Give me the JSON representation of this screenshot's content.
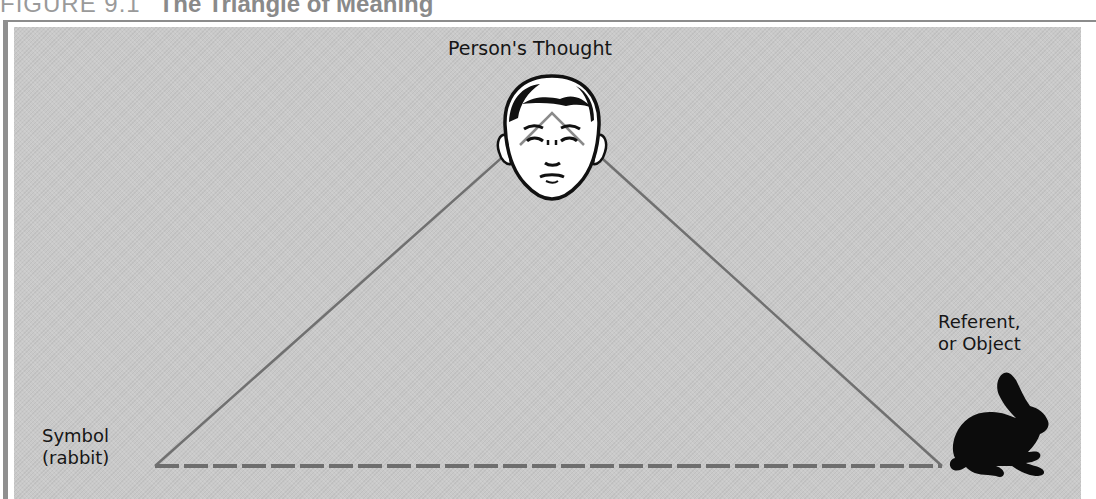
{
  "figure": {
    "number": "FIGURE 9.1",
    "title": "The Triangle of Meaning"
  },
  "diagram": {
    "type": "triangle",
    "nodes": {
      "thought": {
        "label": "Person's Thought",
        "icon": "face-icon"
      },
      "referent": {
        "label_line1": "Referent,",
        "label_line2": "or Object",
        "icon": "rabbit-silhouette-icon"
      },
      "symbol": {
        "label_line1": "Symbol",
        "label_line2": "(rabbit)"
      }
    },
    "edges": [
      {
        "from": "symbol",
        "to": "thought",
        "style": "solid"
      },
      {
        "from": "thought",
        "to": "referent",
        "style": "solid"
      },
      {
        "from": "symbol",
        "to": "referent",
        "style": "dashed"
      }
    ]
  },
  "colors": {
    "panel_background": "#c9c9c9",
    "line": "#6e6e6e",
    "text": "#161616",
    "frame": "#8c8c8c"
  }
}
